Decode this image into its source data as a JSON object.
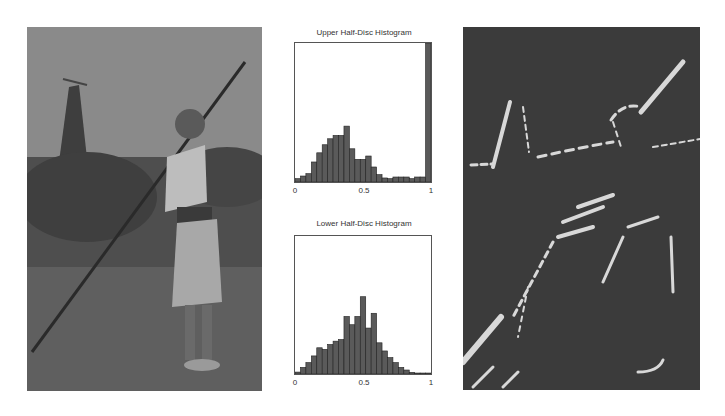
{
  "figure": {
    "left_panel": {
      "description": "grayscale photograph of a person holding a long pole by water with a tower in background"
    },
    "right_panel": {
      "description": "oriented edge response map: bright line segments on dark background"
    }
  },
  "chart_data": [
    {
      "type": "bar",
      "title": "Upper Half-Disc Histogram",
      "xlabel": "",
      "ylabel": "",
      "xlim": [
        0,
        1
      ],
      "xticks": [
        "0",
        "0.5",
        "1"
      ],
      "grid": false,
      "bin_starts": [
        0,
        0.04,
        0.08,
        0.12,
        0.16,
        0.2,
        0.24,
        0.28,
        0.32,
        0.36,
        0.4,
        0.44,
        0.48,
        0.52,
        0.56,
        0.6,
        0.64,
        0.68,
        0.72,
        0.76,
        0.8,
        0.84,
        0.88,
        0.92,
        0.96
      ],
      "values": [
        0.024,
        0.043,
        0.06,
        0.144,
        0.21,
        0.268,
        0.311,
        0.335,
        0.335,
        0.402,
        0.239,
        0.163,
        0.163,
        0.187,
        0.108,
        0.053,
        0.029,
        0.024,
        0.036,
        0.036,
        0.036,
        0.024,
        0.036,
        0.036,
        1.0
      ]
    },
    {
      "type": "bar",
      "title": "Lower Half-Disc Histogram",
      "xlabel": "",
      "ylabel": "",
      "xlim": [
        0,
        1
      ],
      "xticks": [
        "0",
        "0.5",
        "1"
      ],
      "grid": false,
      "bin_starts": [
        0,
        0.04,
        0.08,
        0.12,
        0.16,
        0.2,
        0.24,
        0.28,
        0.32,
        0.36,
        0.4,
        0.44,
        0.48,
        0.52,
        0.56,
        0.6,
        0.64,
        0.68,
        0.72,
        0.76,
        0.8,
        0.84,
        0.88,
        0.92,
        0.96
      ],
      "values": [
        0.014,
        0.048,
        0.083,
        0.131,
        0.19,
        0.179,
        0.214,
        0.238,
        0.25,
        0.417,
        0.357,
        0.417,
        0.56,
        0.333,
        0.44,
        0.226,
        0.167,
        0.119,
        0.083,
        0.048,
        0.029,
        0.012,
        0.007,
        0.007,
        0.007
      ]
    }
  ],
  "upper": {
    "title": "Upper Half-Disc Histogram",
    "ticks": [
      "0",
      "0.5",
      "1"
    ]
  },
  "lower": {
    "title": "Lower Half-Disc Histogram",
    "ticks": [
      "0",
      "0.5",
      "1"
    ]
  },
  "colors": {
    "bar_fill": "#5a5a5a",
    "bar_edge": "#222222",
    "frame": "#555555",
    "photo_bg": "#6f6f6f",
    "edge_bg": "#3b3b3b",
    "edge_line": "#d8d8d8"
  }
}
